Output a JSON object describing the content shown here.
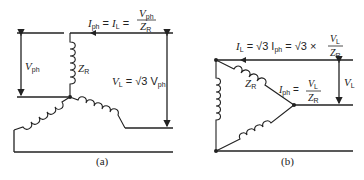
{
  "diagram": {
    "star": {
      "caption": "(a)",
      "labels": {
        "current_eq": {
          "I": "I",
          "I_sub": "ph",
          "eq1": " = ",
          "IL": "I",
          "IL_sub": "L",
          "eq2": " = "
        },
        "fraction": {
          "num": "V",
          "num_sub": "ph",
          "den": "Z",
          "den_sub": "R"
        },
        "vph": {
          "V": "V",
          "sub": "ph"
        },
        "zr": {
          "Z": "Z",
          "sub": "R"
        },
        "vl_eq": {
          "V": "V",
          "sub": "L",
          "rest": " = √3 V",
          "rest_sub": "ph"
        }
      }
    },
    "delta": {
      "caption": "(b)",
      "labels": {
        "line_current_eq": {
          "I": "I",
          "I_sub": "L",
          "eq1": " = √3 I",
          "ph_sub": "ph",
          "eq2": " = √3 × "
        },
        "fraction1": {
          "num": "V",
          "num_sub": "L",
          "den": "Z",
          "den_sub": "R"
        },
        "zr": {
          "Z": "Z",
          "sub": "R"
        },
        "iph_eq": {
          "I": "I",
          "sub": "ph",
          "eq": " = "
        },
        "fraction2": {
          "num": "V",
          "num_sub": "L",
          "den": "Z",
          "den_sub": "R"
        },
        "vl": {
          "V": "V",
          "sub": "L"
        }
      }
    },
    "colors": {
      "ink": "#222222",
      "background": "#ffffff"
    }
  }
}
